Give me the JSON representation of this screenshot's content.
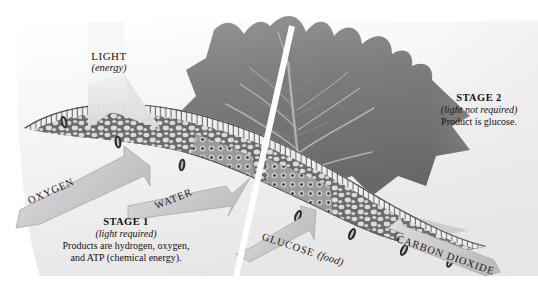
{
  "figure": {
    "background_color": "#ffffff",
    "divider_color": "#ffffff"
  },
  "light": {
    "main": "LIGHT",
    "sub": "(energy)"
  },
  "stage1": {
    "title": "STAGE 1",
    "sub": "(light required)",
    "line1": "Products are hydrogen, oxygen,",
    "line2": "and ATP (chemical energy)."
  },
  "stage2": {
    "title": "STAGE 2",
    "sub": "(light not required)",
    "line1": "Product is glucose."
  },
  "arrows": [
    {
      "id": "oxygen",
      "label": "OXYGEN",
      "sub": "",
      "direction": "out-left-down"
    },
    {
      "id": "water",
      "label": "WATER",
      "sub": "",
      "direction": "in-right-up"
    },
    {
      "id": "glucose",
      "label": "GLUCOSE",
      "sub": "(food)",
      "direction": "out-left-down"
    },
    {
      "id": "carbon-dioxide",
      "label": "CARBON DIOXIDE",
      "sub": "",
      "direction": "in-left-up"
    }
  ],
  "colors": {
    "leaf_blade_dark": "#6f6f6f",
    "leaf_blade_mid": "#8a8a8a",
    "arrow_fill": "#cfcfcf",
    "arrow_stroke": "#9a9a9a",
    "cell_wall": "#5c5c5c",
    "palisade_light": "#ededed",
    "text": "#15120f"
  }
}
